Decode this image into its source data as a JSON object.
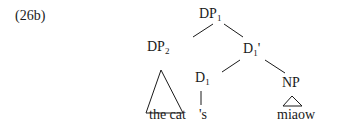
{
  "example_label": "(26b)",
  "tree": {
    "root": {
      "label": "DP",
      "sub": "1"
    },
    "left": {
      "label": "DP",
      "sub": "2",
      "leaf": "the cat"
    },
    "right": {
      "label": "D",
      "sub": "1",
      "prime": "'"
    },
    "d_head": {
      "label": "D",
      "sub": "1",
      "leaf": "'s"
    },
    "np": {
      "label": "NP",
      "leaf": "miaow"
    }
  }
}
